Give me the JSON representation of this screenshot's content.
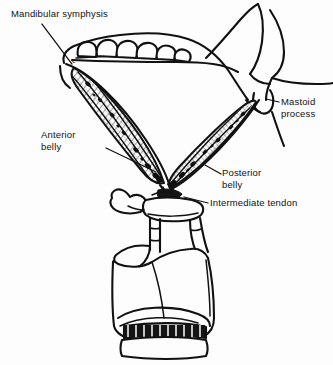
{
  "figure": {
    "background_color": "#fdfdfd",
    "ink_color": "#111111",
    "width": 333,
    "height": 365
  },
  "labels": {
    "mandibular_symphysis": "Mandibular symphysis",
    "mastoid_process": "Mastoid\nprocess",
    "anterior_belly": "Anterior\nbelly",
    "posterior_belly": "Posterior\nbelly",
    "intermediate_tendon": "Intermediate tendon",
    "symphysis_marker": "c"
  },
  "structures": [
    {
      "name": "mandible",
      "label": "Mandible with teeth"
    },
    {
      "name": "mastoid-process",
      "label": "Mastoid process"
    },
    {
      "name": "anterior-belly",
      "label": "Anterior belly of digastric"
    },
    {
      "name": "posterior-belly",
      "label": "Posterior belly of digastric"
    },
    {
      "name": "intermediate-tendon",
      "label": "Intermediate tendon"
    },
    {
      "name": "hyoid-bone",
      "label": "Hyoid bone"
    },
    {
      "name": "larynx",
      "label": "Larynx (thyroid and cricoid cartilage)"
    },
    {
      "name": "trachea",
      "label": "Trachea"
    }
  ]
}
